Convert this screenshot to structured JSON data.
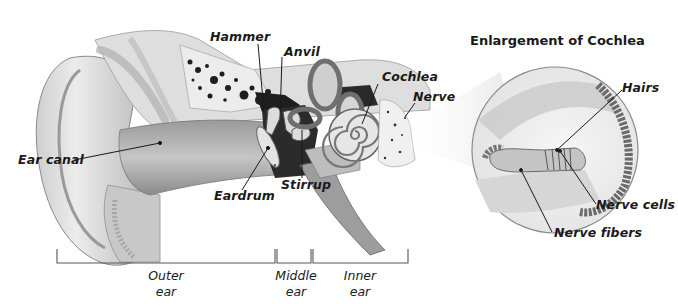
{
  "diagram": {
    "inset": {
      "title": "Enlargement of Cochlea",
      "labels": [
        "Hairs",
        "Nerve cells",
        "Nerve fibers"
      ]
    },
    "labels": {
      "hammer": "Hammer",
      "anvil": "Anvil",
      "cochlea": "Cochlea",
      "nerve": "Nerve",
      "ear_canal": "Ear canal",
      "eardrum": "Eardrum",
      "stirrup": "Stirrup",
      "hairs": "Hairs",
      "nerve_cells": "Nerve cells",
      "nerve_fibers": "Nerve fibers"
    },
    "regions": [
      {
        "line1": "Outer",
        "line2": "ear"
      },
      {
        "line1": "Middle",
        "line2": "ear"
      },
      {
        "line1": "Inner",
        "line2": "ear"
      }
    ],
    "colors": {
      "background": "#ffffff",
      "line": "#222222",
      "tissue_light": "#d9d9d9",
      "tissue_mid": "#a9a9a9",
      "tissue_dark": "#555555",
      "bone_cavity": "#1e1e1e"
    }
  }
}
